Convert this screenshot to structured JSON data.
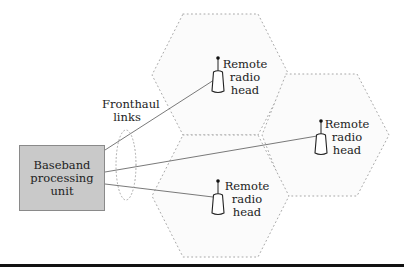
{
  "diagram": {
    "baseband_unit": {
      "label": "Baseband\nprocessing\nunit",
      "fill": "#c9c9c9"
    },
    "fronthaul": {
      "label": "Fronthaul\nlinks"
    },
    "remote_radio_heads": [
      {
        "id": "top",
        "label": "Remote\nradio\nhead",
        "icon": "antenna-icon"
      },
      {
        "id": "right",
        "label": "Remote\nradio\nhead",
        "icon": "antenna-icon"
      },
      {
        "id": "bottom",
        "label": "Remote\nradio\nhead",
        "icon": "antenna-icon"
      }
    ],
    "cells": [
      {
        "id": "top",
        "shape": "hexagon",
        "style": "dotted"
      },
      {
        "id": "right",
        "shape": "hexagon",
        "style": "dotted"
      },
      {
        "id": "bottom",
        "shape": "hexagon",
        "style": "dotted"
      }
    ],
    "links": [
      {
        "from": "baseband_unit",
        "to": "top"
      },
      {
        "from": "baseband_unit",
        "to": "right"
      },
      {
        "from": "baseband_unit",
        "to": "bottom"
      }
    ]
  }
}
